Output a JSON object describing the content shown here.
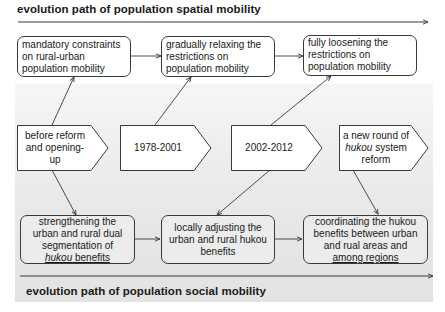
{
  "diagram": {
    "top_title": "evolution path of population spatial mobility",
    "bottom_title": "evolution path of population social mobility",
    "spatial_boxes": [
      {
        "lines": [
          "mandatory constraints",
          "on rural-urban",
          "population mobility"
        ]
      },
      {
        "lines": [
          "gradually relaxing the",
          "restrictions on",
          "population mobility"
        ]
      },
      {
        "lines": [
          "fully loosening the",
          "restrictions on",
          "population mobility"
        ]
      }
    ],
    "periods": [
      {
        "lines": [
          "before reform",
          "and opening-",
          "up"
        ]
      },
      {
        "lines": [
          "1978-2001"
        ]
      },
      {
        "lines": [
          "2002-2012"
        ]
      },
      {
        "line1": "a new round of",
        "line2_italic": "hukou",
        "line2_rest": " system",
        "line3": "reform"
      }
    ],
    "social_boxes": [
      {
        "line1": "strengthening the",
        "line2": "urban and rural dual",
        "line3": "segmentation of",
        "line4_italic": "hukou",
        "line4_rest": " benefits"
      },
      {
        "lines": [
          "locally adjusting the",
          "urban and rural hukou",
          "benefits"
        ]
      },
      {
        "lines": [
          "coordinating the hukou",
          "benefits between urban",
          "and rual areas and",
          "among regions"
        ]
      }
    ],
    "colors": {
      "line": "#3a3a3a",
      "band_gray": "#e8e8e8",
      "box_fill": "#ffffff",
      "bottom_box_fill": "#ececec"
    }
  }
}
